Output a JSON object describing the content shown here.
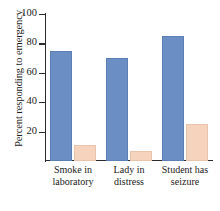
{
  "chart_data": {
    "type": "bar",
    "title": "",
    "xlabel": "",
    "ylabel": "Percent responding to emergency",
    "ylim": [
      0,
      100
    ],
    "yticks": [
      20,
      40,
      60,
      80,
      100
    ],
    "ytick_labels": [
      "20",
      "40",
      "60",
      "80",
      "100"
    ],
    "grid": false,
    "legend_position": "none",
    "categories": [
      "Smoke in laboratory",
      "Lady in distress",
      "Student has seizure"
    ],
    "category_lines": [
      [
        "Smoke in",
        "laboratory"
      ],
      [
        "Lady in",
        "distress"
      ],
      [
        "Student has",
        "seizure"
      ]
    ],
    "series": [
      {
        "name": "Alone",
        "color": "#6b8fc4",
        "values": [
          75,
          70,
          85
        ]
      },
      {
        "name": "In group",
        "color": "#f5d3bd",
        "values": [
          11,
          7,
          25
        ]
      }
    ]
  },
  "colors": {
    "bar_alone": "#6b8fc4",
    "bar_alone_edge": "#5c7fb4",
    "bar_group": "#f5d3bd",
    "bar_group_edge": "#e9c4ab",
    "axis": "#2b2b2b",
    "text": "#1a1a1a",
    "background": "#ffffff"
  }
}
